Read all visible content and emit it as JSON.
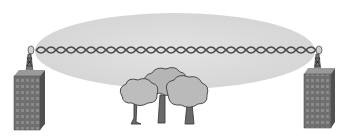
{
  "diagram": {
    "elements": {
      "fresnel_zone": {
        "label": "fresnel-zone-ellipse",
        "color": "#dcdcdc"
      },
      "signal_beam": {
        "label": "line-of-sight-signal",
        "color": "#555555"
      },
      "left_building": {
        "label": "left-building",
        "color": "#6e6e6e"
      },
      "right_building": {
        "label": "right-building",
        "color": "#6e6e6e"
      },
      "left_antenna": {
        "label": "left-antenna-tower"
      },
      "right_antenna": {
        "label": "right-antenna-tower"
      },
      "trees": {
        "label": "tree-obstruction",
        "count": 3,
        "color": "#b4b4b4"
      }
    }
  }
}
